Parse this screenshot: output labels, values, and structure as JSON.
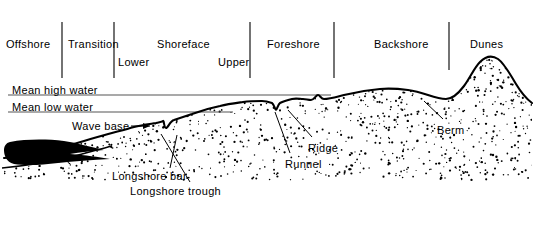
{
  "figure": {
    "ink_color": "#000000",
    "line_color": "#555555",
    "sand_color": "#ffffff",
    "mud_color": "#000000"
  },
  "zones": [
    {
      "id": "offshore",
      "label": "Offshore",
      "x": 6,
      "y": 38
    },
    {
      "id": "transition",
      "label": "Transition",
      "x": 68,
      "y": 38
    },
    {
      "id": "shoreface",
      "label": "Shoreface",
      "x": 157,
      "y": 38
    },
    {
      "id": "lower",
      "label": "Lower",
      "x": 118,
      "y": 56
    },
    {
      "id": "upper",
      "label": "Upper",
      "x": 218,
      "y": 56
    },
    {
      "id": "foreshore",
      "label": "Foreshore",
      "x": 267,
      "y": 38
    },
    {
      "id": "backshore",
      "label": "Backshore",
      "x": 374,
      "y": 38
    },
    {
      "id": "dunes",
      "label": "Dunes",
      "x": 470,
      "y": 38
    }
  ],
  "dividers": [
    {
      "id": "divider-offshore-transition",
      "x": 62,
      "y1": 22,
      "y2": 78
    },
    {
      "id": "divider-transition-lower",
      "x": 114,
      "y1": 22,
      "y2": 78
    },
    {
      "id": "divider-upper-foreshore",
      "x": 250,
      "y1": 22,
      "y2": 78
    },
    {
      "id": "divider-foreshore-backshore",
      "x": 334,
      "y1": 22,
      "y2": 78
    },
    {
      "id": "divider-backshore-dunes",
      "x": 449,
      "y1": 22,
      "y2": 70
    }
  ],
  "water_levels": [
    {
      "id": "mean-high-water",
      "label": "Mean high water",
      "label_x": 12,
      "label_y": 84,
      "line_y": 95,
      "x1": 8,
      "x2": 331
    },
    {
      "id": "mean-low-water",
      "label": "Mean low water",
      "label_x": 12,
      "label_y": 101,
      "line_y": 112,
      "x1": 8,
      "x2": 233
    }
  ],
  "features": [
    {
      "id": "wave-base",
      "label": "Wave base",
      "label_x": 72,
      "label_y": 120,
      "leader": "M131,126 L150,126"
    },
    {
      "id": "longshore-bar",
      "label": "Longshore bar",
      "label_x": 112,
      "label_y": 170,
      "leader": "M170,168 L177,135"
    },
    {
      "id": "longshore-trough",
      "label": "Longshore trough",
      "label_x": 130,
      "label_y": 185,
      "leader": "M190,182 L161,134"
    },
    {
      "id": "runnel",
      "label": "Runnel",
      "label_x": 285,
      "label_y": 158,
      "leader": "M290,153 L275,112"
    },
    {
      "id": "ridge",
      "label": "Ridge",
      "label_x": 308,
      "label_y": 142,
      "leader": "M312,137 L288,110"
    },
    {
      "id": "berm",
      "label": "Berm",
      "label_x": 437,
      "label_y": 124,
      "leader": "M443,119 L424,101"
    }
  ],
  "profile": {
    "surface_path": "M4,158 C30,156 58,149 84,141 C104,135 120,131 134,127 C142,125 150,124 156,123 C160,122 162,122 163,121 C164,120 164,128 166,128 C168,128 170,121 174,120 C180,118 186,116 192,114 C200,111 210,108 220,106 C228,104 236,103 243,102 C250,101 256,101 262,101 C266,101 269,102 272,103 C274,104 275,110 276,110 C277,110 278,104 280,103 C284,101 288,100 292,99 C296,98 300,99 303,99 C306,99 308,100 311,100 C314,100 316,95 318,95 C320,95 321,99 324,99 C330,99 336,97 344,95 C356,92 368,90 380,89 C392,88 400,89 408,90 C416,91 422,93 428,95 C434,97 440,99 446,99 C452,99 458,94 464,86 C470,78 474,68 480,62 C486,56 492,55 498,59 C504,63 510,74 516,84 C522,94 528,100 532,103",
    "sand_fill_path": "M4,158 C30,156 58,149 84,141 C104,135 120,131 134,127 C142,125 150,124 156,123 C160,122 162,122 163,121 C164,120 164,128 166,128 C168,128 170,121 174,120 C180,118 186,116 192,114 C200,111 210,108 220,106 C228,104 236,103 243,102 C250,101 256,101 262,101 C266,101 269,102 272,103 C274,104 275,110 276,110 C277,110 278,104 280,103 C284,101 288,100 292,99 C296,98 300,99 303,99 C306,99 308,100 311,100 C314,100 316,95 318,95 C320,95 321,99 324,99 C330,99 336,97 344,95 C356,92 368,90 380,89 C392,88 400,89 408,90 C416,91 422,93 428,95 C434,97 440,99 446,99 C452,99 458,94 464,86 C470,78 474,68 480,62 C486,56 492,55 498,59 C504,63 510,74 516,84 C522,94 528,100 532,103 L532,205 L4,205 Z",
    "lower_contact_path": "M2,168 C24,166 48,162 70,157 C86,153 100,149 112,146",
    "mud_lens_path": "M10,142 C26,139 46,139 64,141 C78,143 90,147 104,150 C92,151 80,152 70,154 C86,155 98,157 110,159 C92,160 74,161 58,163 C42,165 26,166 14,164 C6,162 4,155 4,150 C4,146 6,143 10,142 Z"
  }
}
